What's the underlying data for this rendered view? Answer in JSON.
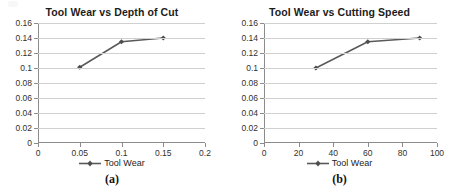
{
  "figure": {
    "panels": [
      {
        "caption": "(a)",
        "legend_label": "Tool Wear",
        "chart_data": {
          "type": "line",
          "title": "Tool Wear vs Depth of Cut",
          "xlabel": "",
          "ylabel": "",
          "x": [
            0.05,
            0.1,
            0.15
          ],
          "values": [
            0.101,
            0.135,
            0.14
          ],
          "series": [
            {
              "name": "Tool Wear",
              "values": [
                0.101,
                0.135,
                0.14
              ]
            }
          ],
          "xlim": [
            0,
            0.2
          ],
          "ylim": [
            0,
            0.16
          ],
          "xticks": [
            0,
            0.05,
            0.1,
            0.15,
            0.2
          ],
          "xticklabels": [
            "0",
            "0.05",
            "0.1",
            "0.15",
            "0.2"
          ],
          "yticks": [
            0,
            0.02,
            0.04,
            0.06,
            0.08,
            0.1,
            0.12,
            0.14,
            0.16
          ],
          "yticklabels": [
            "0",
            "0.02",
            "0.04",
            "0.06",
            "0.08",
            "0.1",
            "0.12",
            "0.14",
            "0.16"
          ],
          "grid": "horizontal",
          "legend_position": "bottom",
          "marker": "diamond",
          "line_color": "#595959"
        }
      },
      {
        "caption": "(b)",
        "legend_label": "Tool Wear",
        "chart_data": {
          "type": "line",
          "title": "Tool Wear vs Cutting Speed",
          "xlabel": "",
          "ylabel": "",
          "x": [
            30,
            60,
            90
          ],
          "values": [
            0.1,
            0.135,
            0.14
          ],
          "series": [
            {
              "name": "Tool Wear",
              "values": [
                0.1,
                0.135,
                0.14
              ]
            }
          ],
          "xlim": [
            0,
            100
          ],
          "ylim": [
            0,
            0.16
          ],
          "xticks": [
            0,
            20,
            40,
            60,
            80,
            100
          ],
          "xticklabels": [
            "0",
            "20",
            "40",
            "60",
            "80",
            "100"
          ],
          "yticks": [
            0,
            0.02,
            0.04,
            0.06,
            0.08,
            0.1,
            0.12,
            0.14,
            0.16
          ],
          "yticklabels": [
            "0",
            "0.02",
            "0.04",
            "0.06",
            "0.08",
            "0.1",
            "0.12",
            "0.14",
            "0.16"
          ],
          "grid": "horizontal",
          "legend_position": "bottom",
          "marker": "diamond",
          "line_color": "#595959"
        }
      }
    ]
  }
}
